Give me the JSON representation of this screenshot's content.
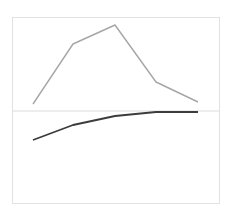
{
  "chart_data": {
    "type": "line",
    "title": "",
    "xlabel": "",
    "ylabel": "",
    "categories": [
      "1",
      "2",
      "3",
      "4",
      "5"
    ],
    "series": [
      {
        "name": "series-upper",
        "color": "#a6a6a6",
        "values": [
          7,
          67,
          86,
          29,
          9
        ]
      },
      {
        "name": "series-lower",
        "color": "#3c3c3c",
        "values": [
          -29,
          -14,
          -5,
          -1,
          -1
        ]
      }
    ],
    "ylim": [
      -92,
      94
    ],
    "baseline": 0,
    "grid": false,
    "legend": "none"
  },
  "layout": {
    "frame": {
      "x": 12,
      "y": 17,
      "width": 207,
      "height": 186,
      "color": "#e2e2e2"
    },
    "baseline_color": "#dcdcdc",
    "x_positions": [
      33,
      73,
      115,
      156,
      198
    ]
  }
}
